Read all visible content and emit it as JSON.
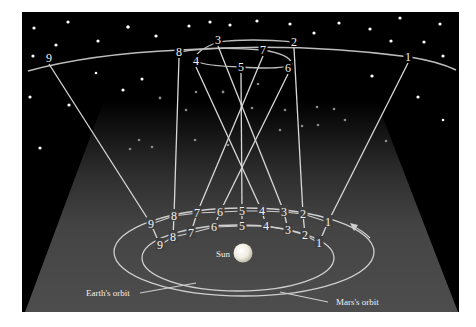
{
  "diagram": {
    "type": "retrograde-motion-of-mars",
    "labels": {
      "sun": "Sun",
      "earth_orbit": "Earth's orbit",
      "mars_orbit": "Mars's orbit"
    },
    "colors": {
      "sky": "#000000",
      "plane": "#4a4a4a",
      "line": "#d8d8d8",
      "text": "#f0f0f0",
      "sun": "#f5f3ea"
    },
    "sky_positions": [
      {
        "n": "1",
        "x": 408,
        "y": 57
      },
      {
        "n": "2",
        "x": 294,
        "y": 42
      },
      {
        "n": "3",
        "x": 218,
        "y": 40
      },
      {
        "n": "4",
        "x": 196,
        "y": 61
      },
      {
        "n": "5",
        "x": 241,
        "y": 67
      },
      {
        "n": "6",
        "x": 288,
        "y": 68
      },
      {
        "n": "7",
        "x": 263,
        "y": 50
      },
      {
        "n": "8",
        "x": 179,
        "y": 52
      },
      {
        "n": "9",
        "x": 49,
        "y": 58
      }
    ],
    "mars_positions": [
      {
        "n": "1",
        "x": 328,
        "y": 222
      },
      {
        "n": "2",
        "x": 303,
        "y": 214
      },
      {
        "n": "3",
        "x": 284,
        "y": 212
      },
      {
        "n": "4",
        "x": 262,
        "y": 211
      },
      {
        "n": "5",
        "x": 242,
        "y": 211
      },
      {
        "n": "6",
        "x": 220,
        "y": 212
      },
      {
        "n": "7",
        "x": 197,
        "y": 213
      },
      {
        "n": "8",
        "x": 174,
        "y": 216
      },
      {
        "n": "9",
        "x": 151,
        "y": 224
      }
    ],
    "earth_positions": [
      {
        "n": "1",
        "x": 319,
        "y": 243
      },
      {
        "n": "2",
        "x": 305,
        "y": 235
      },
      {
        "n": "3",
        "x": 288,
        "y": 230
      },
      {
        "n": "4",
        "x": 266,
        "y": 226
      },
      {
        "n": "5",
        "x": 242,
        "y": 226
      },
      {
        "n": "6",
        "x": 214,
        "y": 227
      },
      {
        "n": "7",
        "x": 191,
        "y": 233
      },
      {
        "n": "8",
        "x": 173,
        "y": 237
      },
      {
        "n": "9",
        "x": 160,
        "y": 245
      }
    ]
  }
}
